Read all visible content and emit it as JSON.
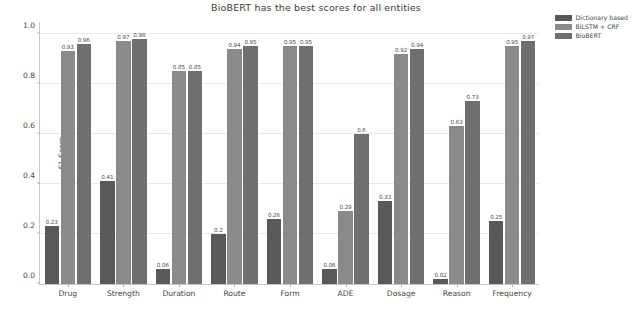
{
  "chart_data": {
    "type": "bar",
    "title": "BioBERT has the best scores for all entities",
    "xlabel": "",
    "ylabel": "F1 Score",
    "ylim": [
      0,
      1.05
    ],
    "yticks": [
      "0.0",
      "0.2",
      "0.4",
      "0.6",
      "0.8",
      "1.0"
    ],
    "ytick_values": [
      0.0,
      0.2,
      0.4,
      0.6,
      0.8,
      1.0
    ],
    "grid": true,
    "legend_position": "upper right",
    "categories": [
      "Drug",
      "Strength",
      "Duration",
      "Route",
      "Form",
      "ADE",
      "Dosage",
      "Reason",
      "Frequency"
    ],
    "series": [
      {
        "name": "Dictionary based",
        "color": "#59595c",
        "values": [
          0.23,
          0.41,
          0.06,
          0.2,
          0.26,
          0.06,
          0.33,
          0.02,
          0.25
        ],
        "labels": [
          "0.23",
          "0.41",
          "0.06",
          "0.2",
          "0.26",
          "0.06",
          "0.33",
          "0.02",
          "0.25"
        ]
      },
      {
        "name": "BiLSTM + CRF",
        "color": "#8a8a8d",
        "values": [
          0.93,
          0.97,
          0.85,
          0.94,
          0.95,
          0.29,
          0.92,
          0.63,
          0.95
        ],
        "labels": [
          "0.93",
          "0.97",
          "0.85",
          "0.94",
          "0.95",
          "0.29",
          "0.92",
          "0.63",
          "0.95"
        ]
      },
      {
        "name": "BioBERT",
        "color": "#6f6f72",
        "values": [
          0.96,
          0.98,
          0.85,
          0.95,
          0.95,
          0.6,
          0.94,
          0.73,
          0.97
        ],
        "labels": [
          "0.96",
          "0.98",
          "0.85",
          "0.95",
          "0.95",
          "0.6",
          "0.94",
          "0.73",
          "0.97"
        ]
      }
    ]
  }
}
